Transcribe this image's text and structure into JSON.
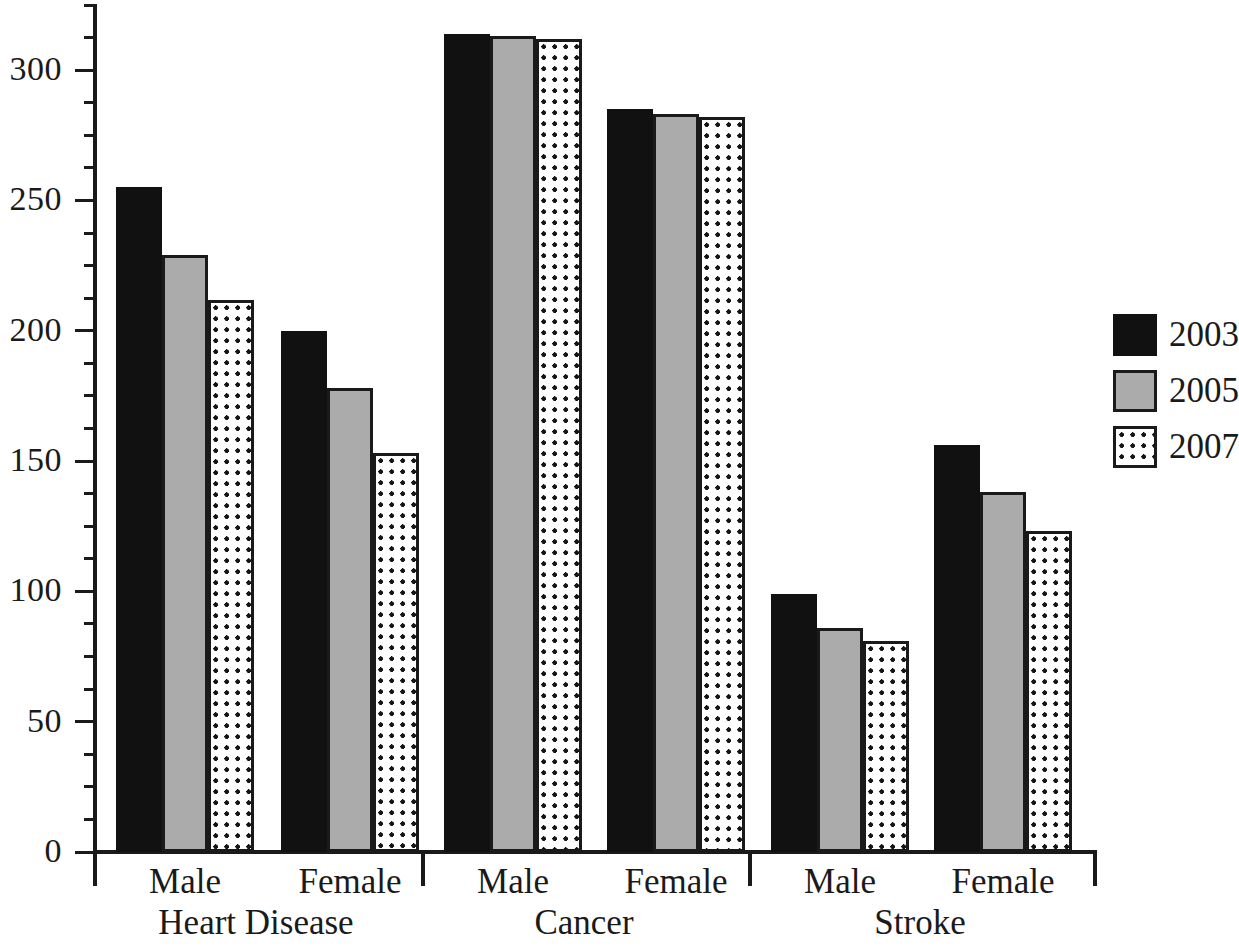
{
  "chart_data": {
    "type": "bar",
    "title": "",
    "subtitle": "",
    "xlabel": "",
    "ylabel": "",
    "ylim": [
      0,
      325
    ],
    "ytick_labels": [
      "0",
      "50",
      "100",
      "150",
      "200",
      "250",
      "300"
    ],
    "ytick_values": [
      0,
      50,
      100,
      150,
      200,
      250,
      300
    ],
    "ytick_minor_step": 12.5,
    "grid": false,
    "legend_position": "right",
    "groups": [
      {
        "name": "Heart Disease",
        "subgroups": [
          {
            "name": "Male",
            "values": [
              255,
              229,
              212
            ]
          },
          {
            "name": "Female",
            "values": [
              200,
              178,
              153
            ]
          }
        ]
      },
      {
        "name": "Cancer",
        "subgroups": [
          {
            "name": "Male",
            "values": [
              314,
              313,
              312
            ]
          },
          {
            "name": "Female",
            "values": [
              285,
              283,
              282
            ]
          }
        ]
      },
      {
        "name": "Stroke",
        "subgroups": [
          {
            "name": "Male",
            "values": [
              99,
              86,
              81
            ]
          },
          {
            "name": "Female",
            "values": [
              156,
              138,
              123
            ]
          }
        ]
      }
    ],
    "series": [
      {
        "name": "2003",
        "pattern": "solid-black",
        "color": "#111111",
        "values": [
          255,
          200,
          314,
          285,
          99,
          156
        ]
      },
      {
        "name": "2005",
        "pattern": "solid-gray",
        "color": "#ababab",
        "values": [
          229,
          178,
          313,
          283,
          86,
          138
        ]
      },
      {
        "name": "2007",
        "pattern": "dotted-white",
        "color": "#ffffff",
        "values": [
          212,
          153,
          312,
          282,
          81,
          123
        ]
      }
    ],
    "categories": [
      "Heart Disease - Male",
      "Heart Disease - Female",
      "Cancer - Male",
      "Cancer - Female",
      "Stroke - Male",
      "Stroke - Female"
    ]
  },
  "legend": {
    "items": [
      {
        "label": "2003",
        "swatch": "black-square-swatch"
      },
      {
        "label": "2005",
        "swatch": "gray-square-swatch"
      },
      {
        "label": "2007",
        "swatch": "dotted-square-swatch"
      }
    ]
  },
  "axis": {
    "y_labels": [
      "300",
      "250",
      "200",
      "150",
      "100",
      "50",
      "0"
    ]
  },
  "colors": {
    "series_2003": "#111111",
    "series_2005": "#ababab",
    "series_2007": "#ffffff",
    "axis": "#1a1a1a",
    "background": "#ffffff"
  }
}
